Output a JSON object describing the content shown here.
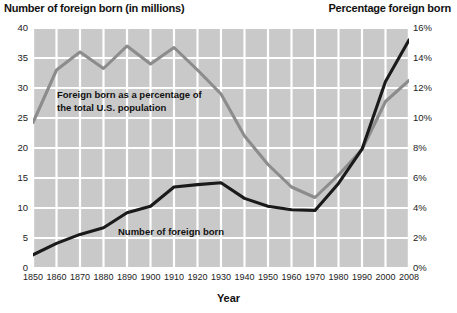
{
  "titles": {
    "left_axis_title": "Number of foreign born (in millions)",
    "right_axis_title": "Percentage foreign born",
    "x_axis_title": "Year"
  },
  "annotations": {
    "gray_line_line1": "Foreign born as a percentage of",
    "gray_line_line2": "the total U.S. population",
    "black_line": "Number of foreign born"
  },
  "colors": {
    "plot_background": "#c9c9c9",
    "gridline": "#ffffff",
    "number_line": "#1a1a1a",
    "percentage_line": "#8c8c8c",
    "text": "#1a1a1a"
  },
  "chart_data": {
    "type": "line",
    "xlabel": "Year",
    "ylabel": "Number of foreign born (in millions)",
    "y2label": "Percentage foreign born",
    "grid": true,
    "legend": "inline-annotations",
    "x": [
      1850,
      1860,
      1870,
      1880,
      1890,
      1900,
      1910,
      1920,
      1930,
      1940,
      1950,
      1960,
      1970,
      1980,
      1990,
      2000,
      2008
    ],
    "xticklabels": [
      "1850",
      "1860",
      "1870",
      "1880",
      "1890",
      "1900",
      "1910",
      "1920",
      "1930",
      "1940",
      "1950",
      "1960",
      "1970",
      "1980",
      "1990",
      "2000",
      "2008"
    ],
    "ylim": [
      0,
      40
    ],
    "yticks": [
      0,
      5,
      10,
      15,
      20,
      25,
      30,
      35,
      40
    ],
    "yticklabels": [
      "0",
      "5",
      "10",
      "15",
      "20",
      "25",
      "30",
      "35",
      "40"
    ],
    "y2lim": [
      0,
      16
    ],
    "y2ticks": [
      0,
      2,
      4,
      6,
      8,
      10,
      12,
      14,
      16
    ],
    "y2ticklabels": [
      "0%",
      "2%",
      "4%",
      "6%",
      "8%",
      "10%",
      "12%",
      "14%",
      "16%"
    ],
    "series": [
      {
        "name": "Number of foreign born",
        "axis": "left",
        "unit": "millions",
        "color": "#1a1a1a",
        "values": [
          2.2,
          4.1,
          5.6,
          6.7,
          9.2,
          10.3,
          13.5,
          13.9,
          14.2,
          11.6,
          10.3,
          9.7,
          9.6,
          14.1,
          19.8,
          31.1,
          38.0
        ]
      },
      {
        "name": "Foreign born as a percentage of the total U.S. population",
        "axis": "right",
        "unit": "percent",
        "color": "#8c8c8c",
        "values": [
          9.7,
          13.2,
          14.4,
          13.3,
          14.8,
          13.6,
          14.7,
          13.2,
          11.6,
          8.8,
          6.9,
          5.4,
          4.7,
          6.2,
          7.9,
          11.1,
          12.5
        ]
      }
    ]
  }
}
